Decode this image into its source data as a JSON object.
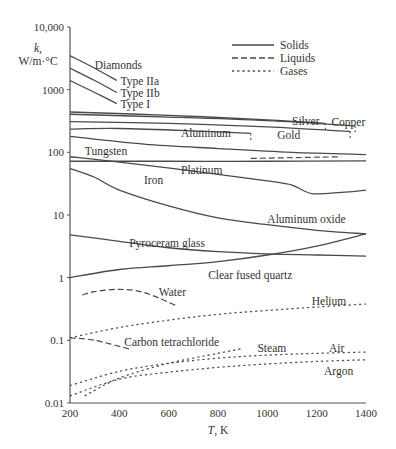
{
  "chart_data": {
    "type": "line",
    "title": "",
    "xlabel": "T, K",
    "ylabel": "k, W/m·°C",
    "ylabel_lines": [
      "k,",
      "W/m·°C"
    ],
    "xscale": "linear",
    "yscale": "log",
    "xlim": [
      200,
      1400
    ],
    "ylim": [
      0.01,
      10000
    ],
    "grid": false,
    "x_ticks": [
      200,
      400,
      600,
      800,
      1000,
      1200,
      1400
    ],
    "x_tick_labels": [
      "200",
      "400",
      "600",
      "800",
      "1000",
      "1200",
      "1400"
    ],
    "y_ticks": [
      0.01,
      0.1,
      1,
      10,
      100,
      1000,
      10000
    ],
    "y_tick_labels": [
      "0.01",
      "0.1",
      "1",
      "10",
      "100",
      "1000",
      "10,000"
    ],
    "legend": {
      "placement": "top-right",
      "entries": [
        {
          "label": "Solids",
          "style": "solid"
        },
        {
          "label": "Liquids",
          "style": "dashed"
        },
        {
          "label": "Gases",
          "style": "dotted"
        }
      ]
    },
    "group_labels": [
      {
        "text": "Diamonds",
        "x": 300,
        "y": 2500
      }
    ],
    "series": [
      {
        "name": "Type IIa",
        "group": "Diamonds",
        "phase": "solid",
        "x": [
          200,
          300,
          390
        ],
        "y": [
          3500,
          2200,
          1400
        ],
        "label": "Type IIa",
        "label_at": [
          405,
          1400
        ]
      },
      {
        "name": "Type IIb",
        "group": "Diamonds",
        "phase": "solid",
        "x": [
          200,
          300,
          390
        ],
        "y": [
          2200,
          1400,
          900
        ],
        "label": "Type IIb",
        "label_at": [
          405,
          900
        ]
      },
      {
        "name": "Type I",
        "group": "Diamonds",
        "phase": "solid",
        "x": [
          200,
          300,
          390
        ],
        "y": [
          1400,
          900,
          600
        ],
        "label": "Type I",
        "label_at": [
          405,
          590
        ]
      },
      {
        "name": "Silver",
        "phase": "solid",
        "x": [
          200,
          600,
          1000,
          1235
        ],
        "y": [
          440,
          390,
          330,
          290
        ],
        "label": "Silver",
        "label_at": [
          1100,
          320
        ],
        "melt_tick": true
      },
      {
        "name": "Copper",
        "phase": "solid",
        "x": [
          200,
          600,
          1000,
          1356
        ],
        "y": [
          405,
          365,
          320,
          265
        ],
        "label": "Copper",
        "label_at": [
          1260,
          300
        ],
        "melt_tick": true
      },
      {
        "name": "Gold",
        "phase": "solid",
        "x": [
          200,
          600,
          1000,
          1336
        ],
        "y": [
          310,
          290,
          255,
          215
        ],
        "label": "Gold",
        "label_at": [
          1040,
          190
        ],
        "melt_tick": true
      },
      {
        "name": "Aluminum",
        "phase": "solid",
        "x": [
          200,
          400,
          700,
          933
        ],
        "y": [
          235,
          240,
          220,
          200
        ],
        "label": "Aluminum",
        "label_at": [
          650,
          200
        ],
        "melt_tick": true
      },
      {
        "name": "Aluminum (liquid)",
        "phase": "liquid",
        "x": [
          933,
          1300
        ],
        "y": [
          80,
          85
        ]
      },
      {
        "name": "Tungsten",
        "phase": "solid",
        "x": [
          200,
          500,
          800,
          1100,
          1400
        ],
        "y": [
          180,
          135,
          115,
          100,
          92
        ],
        "label": "Tungsten",
        "label_at": [
          260,
          105
        ]
      },
      {
        "name": "Platinum",
        "phase": "solid",
        "x": [
          200,
          600,
          1000,
          1400
        ],
        "y": [
          72,
          72,
          72,
          73
        ],
        "label": "Platinum",
        "label_at": [
          650,
          52
        ]
      },
      {
        "name": "Iron",
        "phase": "solid",
        "x": [
          200,
          400,
          700,
          1000,
          1100,
          1180,
          1300,
          1400
        ],
        "y": [
          85,
          70,
          50,
          35,
          30,
          22,
          23,
          25
        ],
        "label": "Iron",
        "label_at": [
          500,
          36
        ]
      },
      {
        "name": "Aluminum oxide",
        "phase": "solid",
        "x": [
          200,
          300,
          400,
          600,
          800,
          1000,
          1200,
          1400
        ],
        "y": [
          55,
          40,
          25,
          14,
          9,
          7,
          5.7,
          5
        ],
        "label": "Aluminum oxide",
        "label_at": [
          1000,
          8.5
        ]
      },
      {
        "name": "Pyroceram glass",
        "phase": "solid",
        "x": [
          200,
          400,
          600,
          800,
          1000,
          1200,
          1400
        ],
        "y": [
          4.8,
          3.8,
          3.0,
          2.6,
          2.4,
          2.3,
          2.2
        ],
        "label": "Pyroceram glass",
        "label_at": [
          440,
          3.6
        ]
      },
      {
        "name": "Clear fused quartz",
        "phase": "solid",
        "x": [
          200,
          400,
          600,
          800,
          1000,
          1200,
          1400
        ],
        "y": [
          1.0,
          1.35,
          1.55,
          1.8,
          2.3,
          3.2,
          5.0
        ],
        "label": "Clear fused quartz",
        "label_at": [
          760,
          1.1
        ]
      },
      {
        "name": "Water",
        "phase": "liquid",
        "x": [
          250,
          300,
          400,
          500,
          630
        ],
        "y": [
          0.53,
          0.6,
          0.65,
          0.58,
          0.36
        ],
        "label": "Water",
        "label_at": [
          560,
          0.58
        ]
      },
      {
        "name": "Carbon tetrachloride",
        "phase": "liquid",
        "x": [
          200,
          300,
          440
        ],
        "y": [
          0.11,
          0.1,
          0.073
        ],
        "label": "Carbon tetrachloride",
        "label_at": [
          420,
          0.095
        ]
      },
      {
        "name": "Helium",
        "phase": "gas",
        "x": [
          200,
          400,
          600,
          800,
          1000,
          1200,
          1400
        ],
        "y": [
          0.11,
          0.16,
          0.21,
          0.26,
          0.3,
          0.34,
          0.38
        ],
        "label": "Helium",
        "label_at": [
          1180,
          0.42
        ]
      },
      {
        "name": "Steam",
        "phase": "gas",
        "x": [
          260,
          400,
          600,
          800,
          900
        ],
        "y": [
          0.013,
          0.025,
          0.043,
          0.062,
          0.074
        ],
        "label": "Steam",
        "label_at": [
          960,
          0.075
        ]
      },
      {
        "name": "Air",
        "phase": "gas",
        "x": [
          200,
          400,
          600,
          800,
          1000,
          1200,
          1400
        ],
        "y": [
          0.019,
          0.032,
          0.043,
          0.052,
          0.058,
          0.062,
          0.065
        ],
        "label": "Air",
        "label_at": [
          1250,
          0.075
        ]
      },
      {
        "name": "Argon",
        "phase": "gas",
        "x": [
          200,
          400,
          600,
          800,
          1000,
          1200,
          1400
        ],
        "y": [
          0.013,
          0.024,
          0.031,
          0.037,
          0.042,
          0.046,
          0.049
        ],
        "label": "Argon",
        "label_at": [
          1230,
          0.033
        ]
      }
    ]
  }
}
